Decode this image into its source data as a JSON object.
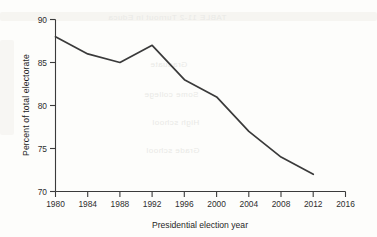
{
  "chart_data": {
    "type": "line",
    "title": "",
    "xlabel": "Presidential election year",
    "ylabel": "Percent of total electorate",
    "x": [
      1980,
      1984,
      1988,
      1992,
      1996,
      2000,
      2004,
      2008,
      2012
    ],
    "values": [
      88,
      86,
      85,
      87,
      83,
      81,
      77,
      74,
      72
    ],
    "series": [
      {
        "name": "Percent of total electorate",
        "values": [
          88,
          86,
          85,
          87,
          83,
          81,
          77,
          74,
          72
        ]
      }
    ],
    "xlim": [
      1980,
      2016
    ],
    "ylim": [
      70,
      90
    ],
    "xticks": [
      "1980",
      "1984",
      "1988",
      "1992",
      "1996",
      "2000",
      "2004",
      "2008",
      "2012",
      "2016"
    ],
    "yticks": [
      "70",
      "75",
      "80",
      "85",
      "90"
    ],
    "grid": false,
    "legend": "none",
    "line_color": "#3a3a3a",
    "axis_color": "#3b3b3b",
    "background_color": "#fdfdfb"
  },
  "artifacts": {
    "bleed_text_1": "TABLE 11-2  Turnout in Educa",
    "bleed_text_2": "Graduate",
    "bleed_text_3": "Some college",
    "bleed_text_4": "High school",
    "bleed_text_5": "Grade school"
  }
}
